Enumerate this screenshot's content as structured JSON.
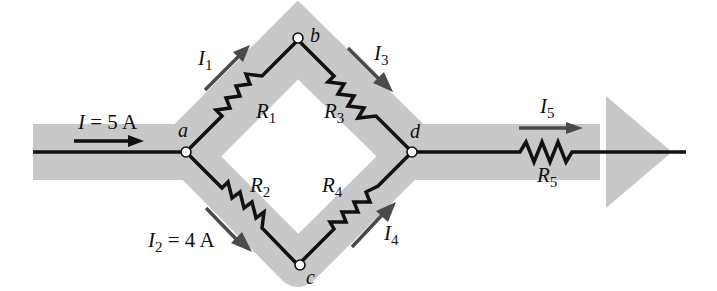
{
  "diagram": {
    "type": "parallel resistor network current flow",
    "colors": {
      "band": "#c8c8c8",
      "wire": "#111111",
      "arrow": "#4a4a4a",
      "node_fill": "#ffffff"
    },
    "nodes": [
      {
        "id": "a",
        "label": "a"
      },
      {
        "id": "b",
        "label": "b"
      },
      {
        "id": "c",
        "label": "c"
      },
      {
        "id": "d",
        "label": "d"
      }
    ],
    "resistors": [
      {
        "id": "R1",
        "main": "R",
        "sub": "1",
        "from": "a",
        "to": "b"
      },
      {
        "id": "R2",
        "main": "R",
        "sub": "2",
        "from": "a",
        "to": "c"
      },
      {
        "id": "R3",
        "main": "R",
        "sub": "3",
        "from": "b",
        "to": "d"
      },
      {
        "id": "R4",
        "main": "R",
        "sub": "4",
        "from": "c",
        "to": "d"
      },
      {
        "id": "R5",
        "main": "R",
        "sub": "5",
        "from": "d",
        "to": "out"
      }
    ],
    "currents": [
      {
        "id": "I",
        "main": "I",
        "sub": "",
        "value_text": " = 5 A"
      },
      {
        "id": "I1",
        "main": "I",
        "sub": "1",
        "value_text": ""
      },
      {
        "id": "I2",
        "main": "I",
        "sub": "2",
        "value_text": " = 4 A"
      },
      {
        "id": "I3",
        "main": "I",
        "sub": "3",
        "value_text": ""
      },
      {
        "id": "I4",
        "main": "I",
        "sub": "4",
        "value_text": ""
      },
      {
        "id": "I5",
        "main": "I",
        "sub": "5",
        "value_text": ""
      }
    ]
  }
}
